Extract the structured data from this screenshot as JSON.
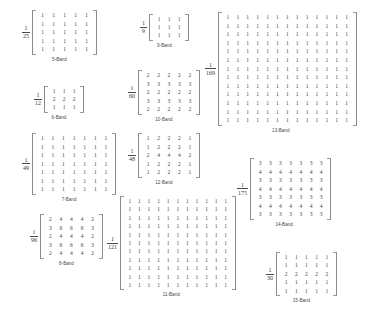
{
  "figure": {
    "title": "",
    "kernels": [
      {
        "id": "band-5",
        "caption": "5-Band",
        "numerator": "1",
        "denominator": "25",
        "rows": [
          [
            1,
            1,
            1,
            1,
            1
          ],
          [
            1,
            1,
            1,
            1,
            1
          ],
          [
            1,
            1,
            1,
            1,
            1
          ],
          [
            1,
            1,
            1,
            1,
            1
          ],
          [
            1,
            1,
            1,
            1,
            1
          ]
        ],
        "x": 22,
        "y": 10,
        "cell_w": 11,
        "row_h": 8.6
      },
      {
        "id": "band-6",
        "caption": "6-Band",
        "numerator": "1",
        "denominator": "12",
        "rows": [
          [
            1,
            1,
            1
          ],
          [
            2,
            2,
            2
          ],
          [
            1,
            1,
            1
          ]
        ],
        "x": 34,
        "y": 86,
        "cell_w": 10,
        "row_h": 8.2
      },
      {
        "id": "band-7",
        "caption": "7-Band",
        "numerator": "1",
        "denominator": "49",
        "rows": [
          [
            1,
            1,
            1,
            1,
            1,
            1,
            1
          ],
          [
            1,
            1,
            1,
            1,
            1,
            1,
            1
          ],
          [
            1,
            1,
            1,
            1,
            1,
            1,
            1
          ],
          [
            1,
            1,
            1,
            1,
            1,
            1,
            1
          ],
          [
            1,
            1,
            1,
            1,
            1,
            1,
            1
          ],
          [
            1,
            1,
            1,
            1,
            1,
            1,
            1
          ],
          [
            1,
            1,
            1,
            1,
            1,
            1,
            1
          ]
        ],
        "x": 22,
        "y": 133,
        "cell_w": 10.6,
        "row_h": 8.5
      },
      {
        "id": "band-8",
        "caption": "8-Band",
        "numerator": "1",
        "denominator": "96",
        "rows": [
          [
            2,
            4,
            4,
            4,
            2
          ],
          [
            3,
            6,
            6,
            6,
            3
          ],
          [
            2,
            4,
            4,
            4,
            2
          ],
          [
            3,
            6,
            6,
            6,
            3
          ],
          [
            2,
            4,
            4,
            4,
            2
          ]
        ],
        "x": 30,
        "y": 214,
        "cell_w": 10.6,
        "row_h": 8.6
      },
      {
        "id": "band-9",
        "caption": "9-Band",
        "numerator": "1",
        "denominator": "9",
        "rows": [
          [
            1,
            1,
            1
          ],
          [
            1,
            1,
            1
          ],
          [
            1,
            1,
            1
          ]
        ],
        "x": 140,
        "y": 14,
        "cell_w": 10,
        "row_h": 8.2
      },
      {
        "id": "band-10",
        "caption": "10-Band",
        "numerator": "1",
        "denominator": "60",
        "rows": [
          [
            2,
            2,
            2,
            2,
            2
          ],
          [
            3,
            3,
            3,
            3,
            3
          ],
          [
            2,
            2,
            2,
            2,
            2
          ],
          [
            3,
            3,
            3,
            3,
            3
          ],
          [
            2,
            2,
            2,
            2,
            2
          ]
        ],
        "x": 128,
        "y": 70,
        "cell_w": 10.4,
        "row_h": 8.5
      },
      {
        "id": "band-11",
        "caption": "11-Band",
        "numerator": "1",
        "denominator": "121",
        "rows": [
          [
            1,
            1,
            1,
            1,
            1,
            1,
            1,
            1,
            1,
            1,
            1
          ],
          [
            1,
            1,
            1,
            1,
            1,
            1,
            1,
            1,
            1,
            1,
            1
          ],
          [
            1,
            1,
            1,
            1,
            1,
            1,
            1,
            1,
            1,
            1,
            1
          ],
          [
            1,
            1,
            1,
            1,
            1,
            1,
            1,
            1,
            1,
            1,
            1
          ],
          [
            1,
            1,
            1,
            1,
            1,
            1,
            1,
            1,
            1,
            1,
            1
          ],
          [
            1,
            1,
            1,
            1,
            1,
            1,
            1,
            1,
            1,
            1,
            1
          ],
          [
            1,
            1,
            1,
            1,
            1,
            1,
            1,
            1,
            1,
            1,
            1
          ],
          [
            1,
            1,
            1,
            1,
            1,
            1,
            1,
            1,
            1,
            1,
            1
          ],
          [
            1,
            1,
            1,
            1,
            1,
            1,
            1,
            1,
            1,
            1,
            1
          ],
          [
            1,
            1,
            1,
            1,
            1,
            1,
            1,
            1,
            1,
            1,
            1
          ],
          [
            1,
            1,
            1,
            1,
            1,
            1,
            1,
            1,
            1,
            1,
            1
          ]
        ],
        "x": 107,
        "y": 196,
        "cell_w": 9.6,
        "row_h": 8.4
      },
      {
        "id": "band-12",
        "caption": "12-Band",
        "numerator": "1",
        "denominator": "48",
        "rows": [
          [
            1,
            2,
            2,
            2,
            1
          ],
          [
            1,
            2,
            2,
            2,
            1
          ],
          [
            2,
            4,
            4,
            4,
            2
          ],
          [
            1,
            2,
            2,
            2,
            1
          ],
          [
            1,
            2,
            2,
            2,
            1
          ]
        ],
        "x": 128,
        "y": 133,
        "cell_w": 10.4,
        "row_h": 8.5
      },
      {
        "id": "band-13",
        "caption": "13-Band",
        "numerator": "1",
        "denominator": "169",
        "rows": [
          [
            1,
            1,
            1,
            1,
            1,
            1,
            1,
            1,
            1,
            1,
            1,
            1,
            1
          ],
          [
            1,
            1,
            1,
            1,
            1,
            1,
            1,
            1,
            1,
            1,
            1,
            1,
            1
          ],
          [
            1,
            1,
            1,
            1,
            1,
            1,
            1,
            1,
            1,
            1,
            1,
            1,
            1
          ],
          [
            1,
            1,
            1,
            1,
            1,
            1,
            1,
            1,
            1,
            1,
            1,
            1,
            1
          ],
          [
            1,
            1,
            1,
            1,
            1,
            1,
            1,
            1,
            1,
            1,
            1,
            1,
            1
          ],
          [
            1,
            1,
            1,
            1,
            1,
            1,
            1,
            1,
            1,
            1,
            1,
            1,
            1
          ],
          [
            1,
            1,
            1,
            1,
            1,
            1,
            1,
            1,
            1,
            1,
            1,
            1,
            1
          ],
          [
            1,
            1,
            1,
            1,
            1,
            1,
            1,
            1,
            1,
            1,
            1,
            1,
            1
          ],
          [
            1,
            1,
            1,
            1,
            1,
            1,
            1,
            1,
            1,
            1,
            1,
            1,
            1
          ],
          [
            1,
            1,
            1,
            1,
            1,
            1,
            1,
            1,
            1,
            1,
            1,
            1,
            1
          ],
          [
            1,
            1,
            1,
            1,
            1,
            1,
            1,
            1,
            1,
            1,
            1,
            1,
            1
          ],
          [
            1,
            1,
            1,
            1,
            1,
            1,
            1,
            1,
            1,
            1,
            1,
            1,
            1
          ],
          [
            1,
            1,
            1,
            1,
            1,
            1,
            1,
            1,
            1,
            1,
            1,
            1,
            1
          ]
        ],
        "x": 205,
        "y": 12,
        "cell_w": 9.9,
        "row_h": 8.6
      },
      {
        "id": "band-14",
        "caption": "14-Band",
        "numerator": "1",
        "denominator": "175",
        "rows": [
          [
            3,
            3,
            3,
            3,
            3,
            3,
            3
          ],
          [
            4,
            4,
            4,
            4,
            4,
            4,
            4
          ],
          [
            3,
            3,
            3,
            3,
            3,
            3,
            3
          ],
          [
            4,
            4,
            4,
            4,
            4,
            4,
            4
          ],
          [
            3,
            3,
            3,
            3,
            3,
            3,
            3
          ],
          [
            4,
            4,
            4,
            4,
            4,
            4,
            4
          ],
          [
            3,
            3,
            3,
            3,
            3,
            3,
            3
          ]
        ],
        "x": 237,
        "y": 158,
        "cell_w": 10.2,
        "row_h": 8.5
      },
      {
        "id": "band-15",
        "caption": "15-Band",
        "numerator": "1",
        "denominator": "30",
        "rows": [
          [
            1,
            1,
            1,
            1,
            1
          ],
          [
            1,
            1,
            1,
            1,
            1
          ],
          [
            2,
            2,
            2,
            2,
            2
          ],
          [
            1,
            1,
            1,
            1,
            1
          ],
          [
            1,
            1,
            1,
            1,
            1
          ]
        ],
        "x": 266,
        "y": 252,
        "cell_w": 10.2,
        "row_h": 8.4
      }
    ]
  }
}
